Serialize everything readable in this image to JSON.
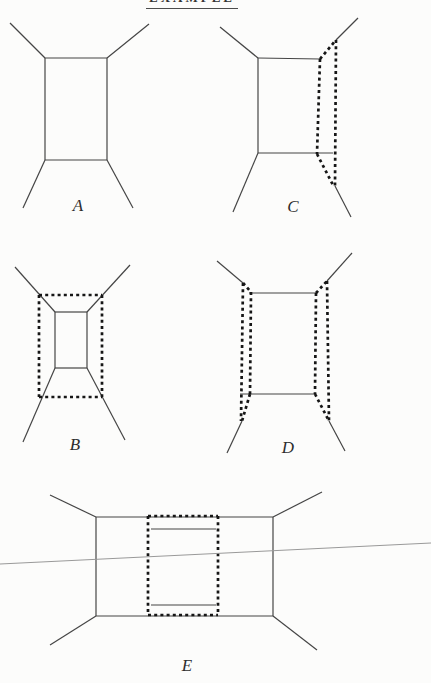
{
  "page": {
    "title": "EXAMPLE",
    "background": "#fcfcfb"
  },
  "style": {
    "solid_color": "#454545",
    "solid_width": 1.2,
    "dash_color": "#161616",
    "dash_width": 2.7,
    "dash_pattern": "3 3.2",
    "horizon_color": "#999999",
    "horizon_width": 1,
    "label_color": "#2d2d2d"
  },
  "horizon_line": {
    "x1": 0,
    "y1": 564,
    "x2": 431,
    "y2": 543
  },
  "figures": [
    {
      "label": "A",
      "label_x": 78,
      "label_y": 211,
      "solid": [
        [
          45,
          58,
          107,
          58
        ],
        [
          107,
          58,
          107,
          160
        ],
        [
          45,
          160,
          107,
          160
        ],
        [
          45,
          58,
          45,
          160
        ],
        [
          45,
          58,
          10,
          23
        ],
        [
          107,
          58,
          149,
          24
        ],
        [
          45,
          160,
          23,
          208
        ],
        [
          107,
          160,
          133,
          208
        ]
      ],
      "dashed": []
    },
    {
      "label": "C",
      "label_x": 293,
      "label_y": 212,
      "solid": [
        [
          258,
          58,
          320,
          59
        ],
        [
          258,
          58,
          258,
          153
        ],
        [
          258,
          153,
          333,
          153
        ],
        [
          258,
          58,
          220,
          27
        ],
        [
          258,
          153,
          233,
          212
        ],
        [
          336,
          40,
          358,
          18
        ],
        [
          335,
          186,
          351,
          217
        ]
      ],
      "dashed": [
        [
          320,
          59,
          317,
          154
        ],
        [
          320,
          59,
          336,
          40
        ],
        [
          336,
          40,
          335,
          186
        ],
        [
          317,
          154,
          334,
          187
        ]
      ]
    },
    {
      "label": "B",
      "label_x": 75,
      "label_y": 450,
      "solid": [
        [
          55,
          312,
          87,
          312
        ],
        [
          87,
          312,
          87,
          368
        ],
        [
          55,
          368,
          87,
          368
        ],
        [
          55,
          312,
          55,
          368
        ],
        [
          55,
          312,
          15,
          267
        ],
        [
          87,
          312,
          130,
          265
        ],
        [
          55,
          368,
          23,
          442
        ],
        [
          87,
          368,
          125,
          440
        ]
      ],
      "dashed": [
        [
          39,
          295,
          102,
          295
        ],
        [
          102,
          295,
          102,
          397
        ],
        [
          39,
          397,
          102,
          397
        ],
        [
          39,
          295,
          39,
          397
        ]
      ]
    },
    {
      "label": "D",
      "label_x": 288,
      "label_y": 453,
      "solid": [
        [
          249,
          293,
          316,
          293
        ],
        [
          240,
          394,
          316,
          394
        ],
        [
          217,
          261,
          243,
          283
        ],
        [
          327,
          281,
          352,
          253
        ],
        [
          242,
          421,
          227,
          453
        ],
        [
          329,
          421,
          345,
          451
        ]
      ],
      "dashed": [
        [
          243,
          283,
          241,
          421
        ],
        [
          251,
          292,
          250,
          394
        ],
        [
          243,
          283,
          251,
          292
        ],
        [
          250,
          394,
          242,
          421
        ],
        [
          327,
          281,
          329,
          421
        ],
        [
          316,
          293,
          315,
          394
        ],
        [
          316,
          293,
          327,
          281
        ],
        [
          315,
          394,
          329,
          421
        ]
      ]
    },
    {
      "label": "E",
      "label_x": 187,
      "label_y": 671,
      "solid": [
        [
          96,
          517,
          273,
          517
        ],
        [
          273,
          517,
          273,
          616
        ],
        [
          96,
          616,
          273,
          616
        ],
        [
          96,
          517,
          96,
          616
        ],
        [
          96,
          517,
          50,
          495
        ],
        [
          273,
          517,
          322,
          492
        ],
        [
          96,
          616,
          50,
          645
        ],
        [
          273,
          616,
          317,
          650
        ],
        [
          151,
          529,
          216,
          529
        ],
        [
          151,
          605,
          216,
          605
        ]
      ],
      "dashed": [
        [
          148,
          516,
          218,
          516
        ],
        [
          218,
          516,
          218,
          615
        ],
        [
          148,
          615,
          218,
          615
        ],
        [
          148,
          516,
          148,
          615
        ]
      ]
    }
  ]
}
